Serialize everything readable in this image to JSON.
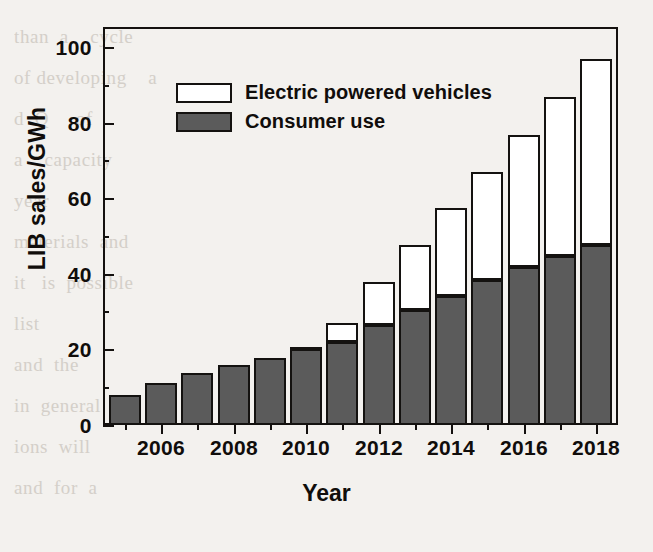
{
  "chart_data": {
    "type": "bar",
    "subtype": "stacked-vertical",
    "title": "",
    "xlabel": "Year",
    "ylabel": "LIB sales/GWh",
    "xlim": [
      2004.4,
      2018.6
    ],
    "ylim": [
      0,
      105
    ],
    "ytick_major": [
      0,
      20,
      40,
      60,
      80,
      100
    ],
    "ytick_minor": [
      10,
      30,
      50,
      70,
      90
    ],
    "ytick_labels": [
      "0",
      "20",
      "40",
      "60",
      "80",
      "100"
    ],
    "xtick_major": [
      2006,
      2008,
      2010,
      2012,
      2014,
      2016,
      2018
    ],
    "xtick_minor": [
      2005,
      2007,
      2009,
      2011,
      2013,
      2015,
      2017
    ],
    "xtick_labels": [
      "2006",
      "2008",
      "2010",
      "2012",
      "2014",
      "2016",
      "2018"
    ],
    "grid": false,
    "legend_position": "upper-left-inside",
    "categories": [
      2005,
      2006,
      2007,
      2008,
      2009,
      2010,
      2011,
      2012,
      2013,
      2014,
      2015,
      2016,
      2017,
      2018
    ],
    "series": [
      {
        "name": "Consumer use",
        "color": "#5b5b5b",
        "edgecolor": "#141210",
        "values": [
          8.0,
          11.0,
          13.8,
          15.8,
          17.8,
          20.1,
          22.0,
          26.5,
          30.5,
          34.2,
          38.4,
          41.7,
          44.6,
          47.5
        ]
      },
      {
        "name": "Electric powered vehicles",
        "color": "#ffffff",
        "edgecolor": "#141210",
        "values": [
          0.0,
          0.0,
          0.0,
          0.0,
          0.0,
          0.6,
          5.0,
          11.2,
          17.2,
          23.3,
          28.4,
          35.1,
          42.1,
          49.3
        ]
      }
    ],
    "totals": [
      8.0,
      11.0,
      13.8,
      15.8,
      17.8,
      20.7,
      27.0,
      37.7,
      47.7,
      57.5,
      66.8,
      76.8,
      86.7,
      96.8
    ]
  },
  "axes": {
    "y_title": "LIB sales/GWh",
    "x_title": "Year"
  },
  "legend": {
    "entries": [
      {
        "label": "Electric powered vehicles",
        "swatch": "hollow-white-box"
      },
      {
        "label": "Consumer use",
        "swatch": "filled-gray-box"
      }
    ]
  },
  "colors": {
    "consumer_fill": "#5b5b5b",
    "ev_fill": "#ffffff",
    "stroke": "#141210",
    "page_background": "#f3f1ee"
  },
  "background_text": "than  a    cycle\nof developing    a\nd  Q     of\na    capacity\nyear\nmaterials  and\nit   is  possible\nlist\nand  the\nin  general  and\nions  will\nand  for  a"
}
